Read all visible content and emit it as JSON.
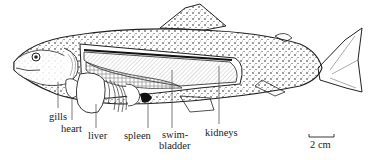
{
  "diagram": {
    "labels": {
      "gills": "gills",
      "heart": "heart",
      "liver": "liver",
      "spleen": "spleen",
      "swim1": "swim-",
      "swim2": "bladder",
      "kidneys": "kidneys"
    },
    "scale_bar": "2 cm"
  }
}
